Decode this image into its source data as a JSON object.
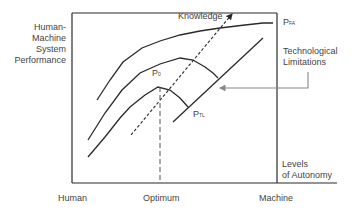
{
  "diagram": {
    "y_axis_label": [
      "Human-",
      "Machine",
      "System",
      "Performance"
    ],
    "x_axis_label": [
      "Levels",
      "of Autonomy"
    ],
    "x_ticks": {
      "left": "Human",
      "middle": "Optimum",
      "right": "Machine"
    },
    "arrow_label": "Knowledge",
    "point_labels": {
      "p0": {
        "main": "P",
        "sub": "0"
      },
      "pfa": {
        "main": "P",
        "sub": "FA"
      },
      "ptl": {
        "main": "P",
        "sub": "TL"
      }
    },
    "annotation": [
      "Technological",
      "Limitations"
    ],
    "colors": {
      "line": "#2a2a2a",
      "annotation_arrow": "#888888",
      "text": "#444444"
    }
  }
}
